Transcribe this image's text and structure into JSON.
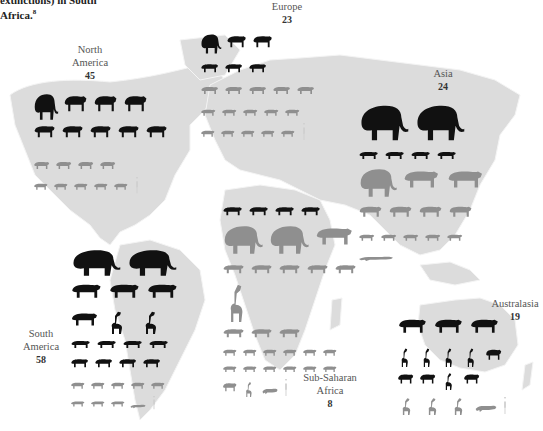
{
  "caption": {
    "line1": "extinctions) in South",
    "line2": "Africa.",
    "superscript": "8"
  },
  "colors": {
    "map_land": "#dcdcdc",
    "map_border": "#f4f4f4",
    "extinct_species": "#111111",
    "surviving_species": "#8f8f8f",
    "human_reference": "#cfcfcf",
    "background": "#ffffff"
  },
  "legend_note": "Black silhouettes = extinct megafauna; grey silhouettes = surviving megafauna; small white/grey figure = human for scale",
  "regions": [
    {
      "id": "north-america",
      "name": "North America",
      "name_lines": [
        "North",
        "America"
      ],
      "count": "45"
    },
    {
      "id": "europe",
      "name": "Europe",
      "name_lines": [
        "Europe"
      ],
      "count": "23"
    },
    {
      "id": "asia",
      "name": "Asia",
      "name_lines": [
        "Asia"
      ],
      "count": "24"
    },
    {
      "id": "south-america",
      "name": "South America",
      "name_lines": [
        "South",
        "America"
      ],
      "count": "58"
    },
    {
      "id": "sub-saharan-africa",
      "name": "Sub-Saharan Africa",
      "name_lines": [
        "Sub-Saharan",
        "Africa"
      ],
      "count": "8"
    },
    {
      "id": "australasia",
      "name": "Australasia",
      "name_lines": [
        "Australasia"
      ],
      "count": "19"
    }
  ],
  "silhouettes": {
    "north-america": {
      "extinct_rows": [
        [
          "mammoth",
          "bison",
          "bear",
          "antelope"
        ],
        [
          "horse",
          "horse",
          "short-faced-bear",
          "lion",
          "cat"
        ]
      ],
      "surviving_rows": [
        [
          "caribou",
          "moose",
          "muskox",
          "bison"
        ],
        [
          "sheep",
          "bear",
          "bear",
          "bear",
          "bear",
          "human"
        ]
      ]
    },
    "europe": {
      "extinct_rows": [
        [
          "mammoth",
          "woolly-rhino",
          "hippo"
        ],
        [
          "cave-bear",
          "steppe-bison",
          "giant-deer"
        ]
      ],
      "surviving_rows": [
        [
          "moose",
          "reindeer",
          "red-deer",
          "deer",
          "boar"
        ],
        [
          "reindeer",
          "boar",
          "bison",
          "muskox",
          "ibex"
        ],
        [
          "chamois",
          "deer",
          "horse",
          "bear",
          "bear",
          "human"
        ]
      ]
    },
    "asia": {
      "extinct_rows": [
        [
          "stegodon",
          "mammoth"
        ],
        [
          "tapir",
          "rhino",
          "bear",
          "hyena"
        ]
      ],
      "surviving_rows": [
        [
          "elephant",
          "tapir",
          "rhino"
        ],
        [
          "rhino",
          "gaur",
          "yak",
          "bison"
        ],
        [
          "tiger",
          "leopard",
          "lion",
          "bear",
          "bear"
        ],
        [
          "crocodile"
        ]
      ]
    },
    "south-america": {
      "extinct_rows": [
        [
          "gomphothere",
          "gomphothere"
        ],
        [
          "toxodon",
          "glyptodont",
          "ground-sloth"
        ],
        [
          "ground-sloth",
          "sloth",
          "sloth"
        ],
        [
          "glyptodont",
          "glyptodont",
          "armadillo",
          "capybara"
        ],
        [
          "horse",
          "horse",
          "macrauchenia",
          "sabertooth"
        ]
      ],
      "surviving_rows": [
        [
          "deer",
          "tapir",
          "llama",
          "peccary",
          "anteater"
        ],
        [
          "jaguar",
          "puma",
          "bear",
          "caiman",
          "human"
        ]
      ]
    },
    "sub-saharan-africa": {
      "extinct_rows": [
        [
          "buffalo",
          "antelope",
          "antelope",
          "zebra"
        ]
      ],
      "surviving_rows": [
        [
          "elephant",
          "elephant",
          "rhino"
        ],
        [
          "rhino",
          "zebra",
          "zebra",
          "pig",
          "pig"
        ],
        [
          "giraffe"
        ],
        [
          "hippo",
          "hyena",
          "eland"
        ],
        [
          "buffalo",
          "kudu",
          "gazelle",
          "gazelle",
          "warthog",
          "antelope"
        ],
        [
          "wildebeest",
          "gorilla",
          "antelope",
          "hyena",
          "lion",
          "antelope"
        ],
        [
          "pangolin",
          "ostrich",
          "crocodile",
          "human"
        ]
      ]
    },
    "australasia": {
      "extinct_rows": [
        [
          "diprotodon",
          "wombat",
          "wombat"
        ],
        [
          "kangaroo",
          "kangaroo",
          "kangaroo",
          "wallaby",
          "wombat"
        ],
        [
          "thylacine",
          "echidna",
          "genyornis",
          "wombat"
        ]
      ],
      "surviving_rows": [
        [
          "kangaroo",
          "emu",
          "cassowary",
          "crocodile",
          "human"
        ]
      ]
    }
  }
}
